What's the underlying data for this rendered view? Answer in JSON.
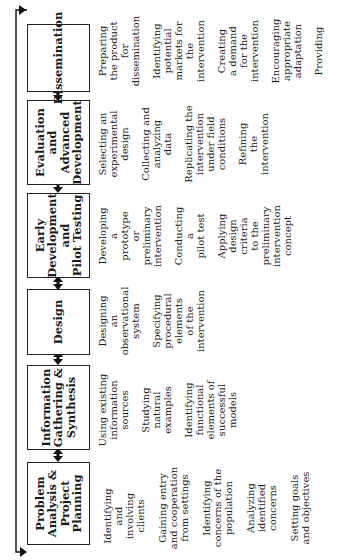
{
  "diagram": {
    "orientation": "rotated-90-ccw",
    "flow": "bidirectional arrows between adjacent stages; feedback loop from Dissemination back to Problem Analysis & Project Planning",
    "stages": [
      {
        "title": "Problem\nAnalysis &\nProject\nPlanning",
        "activities": [
          "Identifying\nand\ninvolving\nclients",
          "Gaining entry\nand cooperation\nfrom settings",
          "Identifying\nconcerns of the\npopulation",
          "Analyzing\nidentified\nconcerns",
          "Setting goals\nand objectives"
        ]
      },
      {
        "title": "Information\nGathering &\nSynthesis",
        "activities": [
          "Using existing\ninformation\nsources",
          "Studying\nnatural\nexamples",
          "Identifying\nfunctional\nelements of\nsuccessful\nmodels"
        ]
      },
      {
        "title": "Design",
        "activities": [
          "Designing\nan\nobservational\nsystem",
          "Specifying\nprocedural\nelements\nof the\nintervention"
        ]
      },
      {
        "title": "Early\nDevelopment\nand\nPilot Testing",
        "activities": [
          "Developing\na\nprototype\nor\npreliminary\nintervention",
          "Conducting\na\npilot test",
          "Applying\ndesign\ncriteria\nto the\npreliminary\nintervention\nconcept"
        ]
      },
      {
        "title": "Evaluation\nand\nAdvanced\nDevelopment",
        "activities": [
          "Selecting an\nexperimental\ndesign",
          "Collecting and\nanalyzing\ndata",
          "Replicating the\nintervention\nunder field\nconditions",
          "Refining\nthe\nintervention"
        ]
      },
      {
        "title": "Dissemination",
        "activities": [
          "Preparing\nthe product\nfor\ndissemination",
          "Identifying\npotential\nmarkets for\nthe\nintervention",
          "Creating\na demand\nfor the\nintervention",
          "Encouraging\nappropriate\nadaptation",
          "Providing"
        ]
      }
    ]
  }
}
